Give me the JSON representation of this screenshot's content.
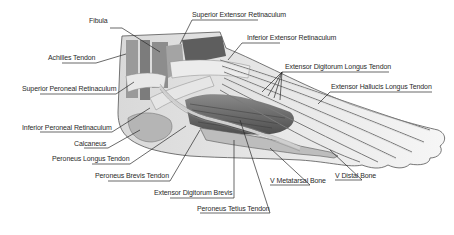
{
  "diagram": {
    "colors": {
      "background": "#ffffff",
      "ink": "#2a2a2a",
      "skin_outline": "#555555",
      "tendon_light": "#e6e6e6",
      "muscle_dark": "#6e6e6e"
    },
    "labels": [
      {
        "id": "fibula",
        "text": "Fibula"
      },
      {
        "id": "superior-extensor-retinaculum",
        "text": "Superior Extensor Retinaculum"
      },
      {
        "id": "inferior-extensor-retinaculum",
        "text": "Inferior Extensor Retinaculum"
      },
      {
        "id": "achilles-tendon",
        "text": "Achilles Tendon"
      },
      {
        "id": "extensor-digitorum-longus-tendon",
        "text": "Extensor Digitorum Longus Tendon"
      },
      {
        "id": "extensor-hallucis-longus-tendon",
        "text": "Extensor Hallucis Longus Tendon"
      },
      {
        "id": "superior-peroneal-retinaculum",
        "text": "Superior Peroneal Retinaculum"
      },
      {
        "id": "inferior-peroneal-retinaculum",
        "text": "Inferior Peroneal Retinaculum"
      },
      {
        "id": "calcaneus",
        "text": "Calcaneus"
      },
      {
        "id": "peroneus-longus-tendon",
        "text": "Peroneus Longus Tendon"
      },
      {
        "id": "peroneus-brevis-tendon",
        "text": "Peroneus Brevis Tendon"
      },
      {
        "id": "extensor-digitorum-brevis",
        "text": "Extensor Digitorum Brevis"
      },
      {
        "id": "peroneus-tetius-tendon",
        "text": "Peroneus Tetius Tendon"
      },
      {
        "id": "v-metatarsal-bone",
        "text": "V Metatarsal Bone"
      },
      {
        "id": "v-distal-bone",
        "text": "V Distal Bone"
      }
    ]
  }
}
